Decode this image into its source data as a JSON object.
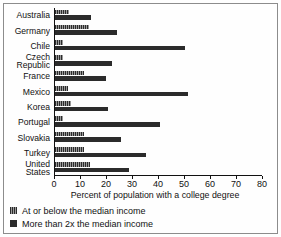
{
  "chart_data": {
    "type": "bar",
    "orientation": "horizontal",
    "title": "",
    "xlabel": "Percent of population with a college degree",
    "ylabel": "",
    "xlim": [
      0,
      80
    ],
    "xticks": [
      0,
      10,
      20,
      30,
      40,
      50,
      60,
      70,
      80
    ],
    "grid": false,
    "legend_position": "below",
    "categories": [
      "Australia",
      "Germany",
      "Chile",
      "Czech\nRepublic",
      "France",
      "Mexico",
      "Korea",
      "Portugal",
      "Slovakia",
      "Turkey",
      "United\nStates"
    ],
    "series": [
      {
        "name": "At or below the median income",
        "color": "#3a3a3a",
        "values": [
          5.5,
          13,
          3,
          3,
          11,
          5,
          6,
          3,
          11,
          11,
          13.5
        ]
      },
      {
        "name": "More than 2x the median income",
        "color": "#2b2b2b",
        "values": [
          14,
          24,
          50,
          22,
          19.5,
          51,
          20.5,
          40.5,
          25.5,
          35,
          28.5
        ]
      }
    ]
  },
  "legend": {
    "items": [
      {
        "label": "At or below the median income"
      },
      {
        "label": "More than 2x the median income"
      }
    ]
  }
}
